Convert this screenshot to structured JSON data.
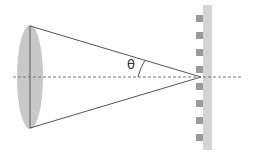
{
  "diagram": {
    "title": "",
    "angle_label": "θ",
    "elements": {
      "lens": {
        "cx": 30,
        "cy": 77,
        "rx": 13,
        "ry": 52,
        "fill": "#c8c8c8"
      },
      "lens_axis": {
        "x": 30,
        "y1": 26,
        "y2": 128
      },
      "cone_apex": {
        "x": 201,
        "y": 77
      },
      "optical_axis": {
        "y": 77,
        "x1": 13,
        "x2": 243,
        "style": "dashed"
      },
      "grating": {
        "strip": {
          "x": 203,
          "y": 5,
          "width": 9,
          "height": 145,
          "fill": "#d4d4d4"
        },
        "squares": {
          "x": 196,
          "size": 7,
          "ys": [
            15,
            32,
            49,
            66,
            83,
            100,
            117,
            134
          ],
          "fill": "#9a9a9a"
        }
      }
    },
    "colors": {
      "line": "#555555",
      "dash": "#777777"
    }
  }
}
